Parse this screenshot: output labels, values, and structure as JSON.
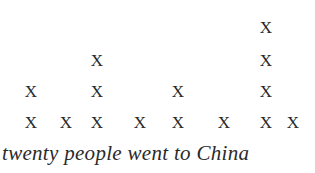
{
  "chart_data": {
    "type": "dot-plot",
    "title": "",
    "caption": "twenty people went to China",
    "marker": "X",
    "columns": [
      {
        "x_px": 31,
        "count": 2
      },
      {
        "x_px": 66,
        "count": 1
      },
      {
        "x_px": 97,
        "count": 3
      },
      {
        "x_px": 140,
        "count": 1
      },
      {
        "x_px": 178,
        "count": 2
      },
      {
        "x_px": 224,
        "count": 1
      },
      {
        "x_px": 266,
        "count": 4
      },
      {
        "x_px": 293,
        "count": 1
      }
    ],
    "values": [
      2,
      1,
      3,
      1,
      2,
      1,
      4,
      1
    ],
    "row_y_px": [
      122,
      91,
      60,
      27
    ],
    "xlabel": "",
    "ylabel": "",
    "grid": false
  }
}
